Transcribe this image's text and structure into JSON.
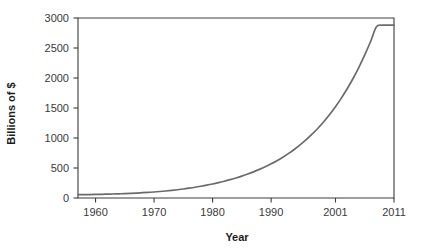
{
  "chart_data": {
    "type": "line",
    "title": "",
    "xlabel": "Year",
    "ylabel": "Billions of $",
    "xlim": [
      1957,
      2011
    ],
    "ylim": [
      0,
      3000
    ],
    "grid": false,
    "legend": null,
    "line_color": "#6b6b6b",
    "axis_color": "#3c3c3c",
    "x_tick_labels": [
      "1960",
      "1970",
      "1980",
      "1990",
      "2001",
      "2011"
    ],
    "x_tick_values": [
      1960,
      1970,
      1980,
      1990,
      2001,
      2011
    ],
    "y_tick_labels": [
      "0",
      "500",
      "1000",
      "1500",
      "2000",
      "2500",
      "3000"
    ],
    "y_tick_values": [
      0,
      500,
      1000,
      1500,
      2000,
      2500,
      3000
    ],
    "x": [
      1957,
      1958,
      1959,
      1960,
      1961,
      1962,
      1963,
      1964,
      1965,
      1966,
      1967,
      1968,
      1969,
      1970,
      1971,
      1972,
      1973,
      1974,
      1975,
      1976,
      1977,
      1978,
      1979,
      1980,
      1981,
      1982,
      1983,
      1984,
      1985,
      1986,
      1987,
      1988,
      1989,
      1990,
      1991,
      1992,
      1993,
      1994,
      1995,
      1996,
      1997,
      1998,
      1999,
      2000,
      2001,
      2002,
      2003,
      2004,
      2005,
      2006,
      2007,
      2008,
      2009,
      2010,
      2011
    ],
    "y": [
      55,
      55,
      57,
      59,
      61,
      64,
      67,
      70,
      73,
      77,
      82,
      88,
      94,
      100,
      108,
      117,
      127,
      138,
      150,
      164,
      179,
      196,
      214,
      234,
      256,
      280,
      306,
      334,
      365,
      399,
      436,
      477,
      521,
      569,
      622,
      680,
      744,
      813,
      889,
      972,
      1063,
      1163,
      1272,
      1391,
      1522,
      1665,
      1821,
      1992,
      2179,
      2384,
      2608,
      2854,
      2880,
      2880,
      2880
    ],
    "series": [
      {
        "name": "Total",
        "values": [
          55,
          55,
          57,
          59,
          61,
          64,
          67,
          70,
          73,
          77,
          82,
          88,
          94,
          100,
          108,
          117,
          127,
          138,
          150,
          164,
          179,
          196,
          214,
          234,
          256,
          280,
          306,
          334,
          365,
          399,
          436,
          477,
          521,
          569,
          622,
          680,
          744,
          813,
          889,
          972,
          1063,
          1163,
          1272,
          1391,
          1522,
          1665,
          1821,
          1992,
          2179,
          2384,
          2608,
          2854,
          2880,
          2880,
          2880
        ]
      }
    ],
    "annotations": []
  }
}
